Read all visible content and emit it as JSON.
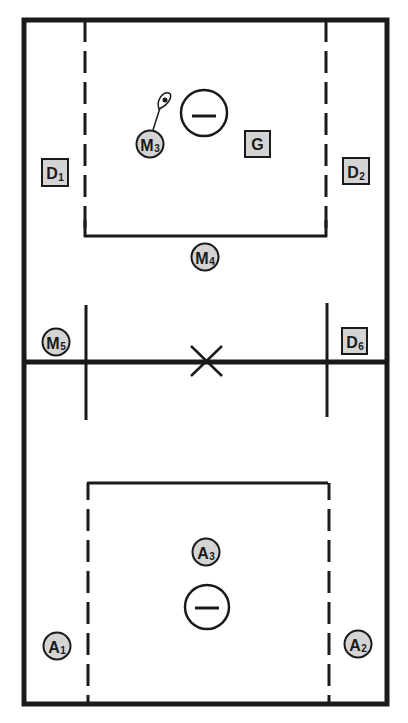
{
  "diagram": {
    "type": "lacrosse-field-positions",
    "colors": {
      "line": "#1a1a1a",
      "player_fill": "#d4d4d4",
      "background": "#ffffff"
    },
    "players_circle": [
      {
        "id": "M3",
        "letter": "M",
        "sub": "3",
        "cx": 150,
        "cy": 144,
        "has_ball": true
      },
      {
        "id": "M4",
        "letter": "M",
        "sub": "4",
        "cx": 205,
        "cy": 257
      },
      {
        "id": "M5",
        "letter": "M",
        "sub": "5",
        "cx": 56,
        "cy": 342
      },
      {
        "id": "A3",
        "letter": "A",
        "sub": "3",
        "cx": 206,
        "cy": 552
      },
      {
        "id": "A1",
        "letter": "A",
        "sub": "1",
        "cx": 57,
        "cy": 646
      },
      {
        "id": "A2",
        "letter": "A",
        "sub": "2",
        "cx": 358,
        "cy": 644
      }
    ],
    "players_square": [
      {
        "id": "G",
        "letter": "G",
        "sub": "",
        "x": 245,
        "y": 131
      },
      {
        "id": "D1",
        "letter": "D",
        "sub": "1",
        "x": 42,
        "y": 159
      },
      {
        "id": "D2",
        "letter": "D",
        "sub": "2",
        "x": 343,
        "y": 158
      },
      {
        "id": "D6",
        "letter": "D",
        "sub": "6",
        "x": 342,
        "y": 328
      }
    ],
    "goals": [
      {
        "name": "top-goal",
        "cx": 204,
        "cy": 113,
        "r": 23
      },
      {
        "name": "bottom-goal",
        "cx": 207,
        "cy": 607,
        "r": 22
      }
    ],
    "center_mark": {
      "cx": 207,
      "cy": 361
    }
  }
}
